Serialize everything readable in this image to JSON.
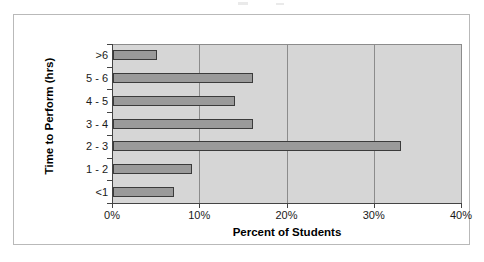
{
  "figure": {
    "background_color": "#ffffff",
    "frame_color": "#b9b9b9",
    "plot_background_color": "#d6d6d6",
    "bar_fill_color": "#9a9a9a",
    "bar_border_color": "#3b3b3b",
    "gridline_color": "#8c8c8c",
    "axis_color": "#444444"
  },
  "chart_data": {
    "type": "bar",
    "orientation": "horizontal",
    "title": "",
    "xlabel": "Percent of Students",
    "ylabel": "Time to Perform (hrs)",
    "categories": [
      "<1",
      "1 - 2",
      "2 - 3",
      "3 - 4",
      "4 - 5",
      "5 - 6",
      ">6"
    ],
    "values": [
      7,
      9,
      33,
      16,
      14,
      16,
      5
    ],
    "value_unit": "%",
    "xlim": [
      0,
      40
    ],
    "xticks": [
      0,
      10,
      20,
      30,
      40
    ],
    "xtick_labels": [
      "0%",
      "10%",
      "20%",
      "30%",
      "40%"
    ],
    "grid": "vertical",
    "legend": "none",
    "bars": [
      {
        "category": ">6",
        "value": 5
      },
      {
        "category": "5 - 6",
        "value": 16
      },
      {
        "category": "4 - 5",
        "value": 14
      },
      {
        "category": "3 - 4",
        "value": 16
      },
      {
        "category": "2 - 3",
        "value": 33
      },
      {
        "category": "1 - 2",
        "value": 9
      },
      {
        "category": "<1",
        "value": 7
      }
    ]
  }
}
